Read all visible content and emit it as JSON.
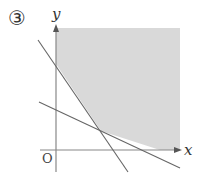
{
  "problem": {
    "number_label": "③"
  },
  "axes": {
    "x_label": "x",
    "y_label": "y",
    "origin_label": "O"
  },
  "style": {
    "shade_color": "#d9d9d9",
    "axis_color": "#888888",
    "line_color": "#666666"
  },
  "diagram": {
    "lines": [
      {
        "name": "steep-line",
        "x1": 38,
        "y1": 40,
        "x2": 128,
        "y2": 172
      },
      {
        "name": "shallow-line",
        "x1": 39,
        "y1": 102,
        "x2": 180,
        "y2": 168
      }
    ],
    "intersection": {
      "x": 101,
      "y": 131
    },
    "shaded_region": "x >= 0, above both lines"
  }
}
